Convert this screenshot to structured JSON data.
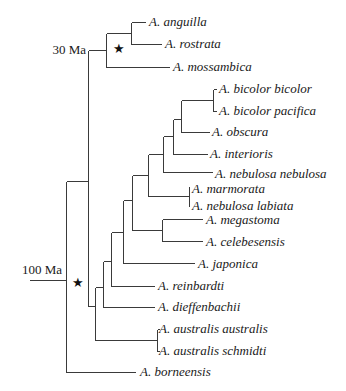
{
  "figure": {
    "type": "phylogenetic-tree",
    "time_labels": [
      {
        "id": "t30",
        "text": "30 Ma",
        "x": 86,
        "y": 54
      },
      {
        "id": "t100",
        "text": "100 Ma",
        "x": 62,
        "y": 269
      }
    ],
    "stars": [
      {
        "id": "star-atlantic",
        "glyph": "★",
        "x": 118,
        "y": 52
      },
      {
        "id": "star-indopacific",
        "glyph": "★",
        "x": 78,
        "y": 289
      }
    ],
    "leaves": [
      {
        "name": "A. anguilla",
        "y": 22,
        "x_end": 146
      },
      {
        "name": "A. rostrata",
        "y": 44,
        "x_end": 162
      },
      {
        "name": "A. mossambica",
        "y": 67,
        "x_end": 170
      },
      {
        "name": "A. bicolor bicolor",
        "y": 89,
        "x_end": 217
      },
      {
        "name": "A. bicolor pacifica",
        "y": 111,
        "x_end": 217
      },
      {
        "name": "A. obscura",
        "y": 132,
        "x_end": 210
      },
      {
        "name": "A. interioris",
        "y": 154,
        "x_end": 208
      },
      {
        "name": "A. nebulosa nebulosa",
        "y": 174,
        "x_end": 213
      },
      {
        "name": "A. marmorata",
        "y": 189,
        "x_end": 190
      },
      {
        "name": "A. nebulosa labiata",
        "y": 206,
        "x_end": 190
      },
      {
        "name": "A. megastoma",
        "y": 220,
        "x_end": 203
      },
      {
        "name": "A. celebesensis",
        "y": 242,
        "x_end": 203
      },
      {
        "name": "A. japonica",
        "y": 264,
        "x_end": 195
      },
      {
        "name": "A. reinbardti",
        "y": 286,
        "x_end": 155
      },
      {
        "name": "A. dieffenbachii",
        "y": 307,
        "x_end": 155
      },
      {
        "name": "A. australis australis",
        "y": 329,
        "x_end": 157
      },
      {
        "name": "A. australis schmidti",
        "y": 351,
        "x_end": 157
      },
      {
        "name": "A. borneensis",
        "y": 372,
        "x_end": 136
      }
    ],
    "colors": {
      "branch": "#3a3a3a",
      "text": "#1a1a1a",
      "background": "#ffffff"
    }
  }
}
